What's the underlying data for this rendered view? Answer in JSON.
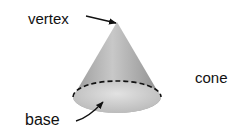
{
  "diagram": {
    "labels": {
      "vertex": "vertex",
      "base": "base",
      "shape_name": "cone"
    },
    "colors": {
      "cone_fill": "#a9a9a9",
      "base_fill": "#d4d4d4",
      "text": "#111111"
    }
  }
}
